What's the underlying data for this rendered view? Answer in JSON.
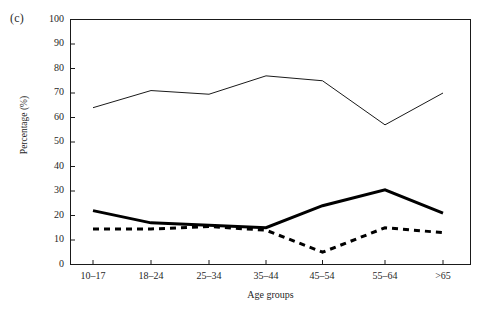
{
  "panel": {
    "label": "(c)"
  },
  "chart_data": {
    "type": "line",
    "title": "",
    "subtitle": "",
    "xlabel": "Age groups",
    "ylabel": "Percentage (%)",
    "categories": [
      "10–17",
      "18–24",
      "25–34",
      "35–44",
      "45–54",
      "55–64",
      ">65"
    ],
    "ylim": [
      0,
      100
    ],
    "ytick_labels": [
      "0",
      "10",
      "20",
      "30",
      "40",
      "50",
      "60",
      "70",
      "80",
      "90",
      "100"
    ],
    "yticks": [
      0,
      10,
      20,
      30,
      40,
      50,
      60,
      70,
      80,
      90,
      100
    ],
    "grid": false,
    "legend": "none",
    "legend_position": "none",
    "series": [
      {
        "name": "thin-solid-series",
        "style": "solid-thin",
        "color": "#1a1a1a",
        "line_width": 1,
        "values": [
          64,
          71,
          69.5,
          77,
          75,
          57,
          70
        ]
      },
      {
        "name": "bold-solid-series",
        "style": "solid-bold",
        "color": "#000000",
        "line_width": 3,
        "values": [
          22,
          17,
          16,
          15,
          24,
          30.5,
          21
        ]
      },
      {
        "name": "dashed-series",
        "style": "dashed-bold",
        "color": "#000000",
        "line_width": 3,
        "values": [
          14.5,
          14.5,
          15.5,
          14,
          5,
          15,
          13
        ]
      }
    ],
    "annotations": [
      "(c)"
    ]
  },
  "axes": {
    "frame_color": "#1a1a1a",
    "tick_color": "#1a1a1a"
  }
}
